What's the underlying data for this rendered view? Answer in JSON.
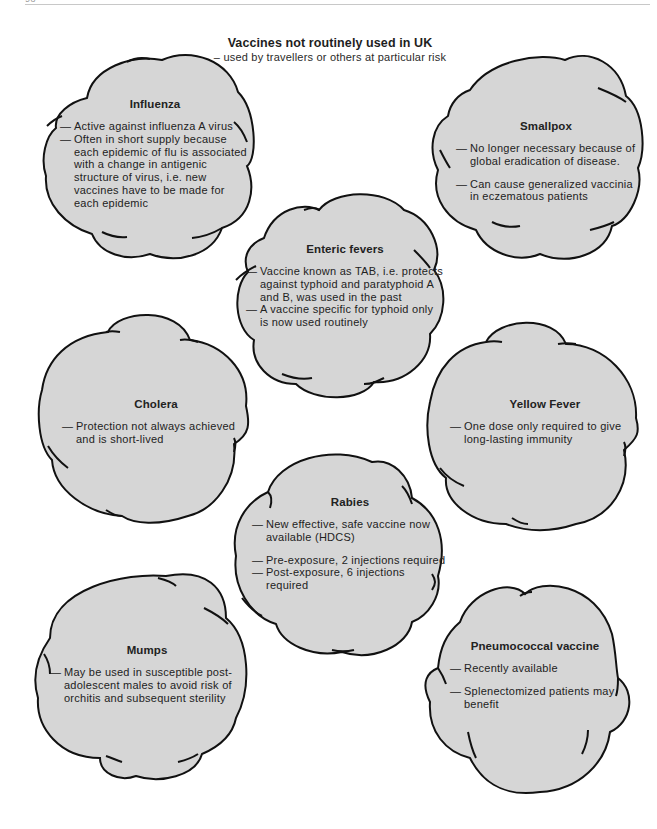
{
  "page": {
    "number": "98"
  },
  "header": {
    "title": "Vaccines not routinely used in UK",
    "subtitle": "– used by travellers or others at particular risk"
  },
  "style": {
    "cloud_fill": "#d6d6d6",
    "cloud_stroke": "#111111",
    "background": "#ffffff"
  },
  "clouds": [
    {
      "id": "influenza",
      "title": "Influenza",
      "points": [
        "Active against influenza A virus",
        "Often in short supply because each epidemic of flu is associated with a change in antigenic structure of virus, i.e. new vaccines have to be made for each epidemic"
      ]
    },
    {
      "id": "smallpox",
      "title": "Smallpox",
      "points": [
        "No longer necessary because of global eradication of disease.",
        "Can cause generalized vaccinia in eczematous patients"
      ]
    },
    {
      "id": "enteric-fevers",
      "title": "Enteric fevers",
      "points": [
        "Vaccine known as TAB, i.e. protects against typhoid and paratyphoid A and B, was used in the past",
        "A vaccine specific for typhoid only is now used routinely"
      ]
    },
    {
      "id": "cholera",
      "title": "Cholera",
      "points": [
        "Protection not always achieved and is short-lived"
      ]
    },
    {
      "id": "yellow-fever",
      "title": "Yellow Fever",
      "points": [
        "One dose only required to give long-lasting immunity"
      ]
    },
    {
      "id": "rabies",
      "title": "Rabies",
      "points": [
        "New effective, safe vaccine now available (HDCS)",
        "Pre-exposure, 2 injections required",
        "Post-exposure, 6 injections required"
      ]
    },
    {
      "id": "mumps",
      "title": "Mumps",
      "points": [
        "May be used in susceptible post-adolescent males to avoid risk of orchitis and subsequent sterility"
      ]
    },
    {
      "id": "pneumococcal",
      "title": "Pneumococcal vaccine",
      "points": [
        "Recently available",
        "Splenectomized patients may benefit"
      ]
    }
  ]
}
